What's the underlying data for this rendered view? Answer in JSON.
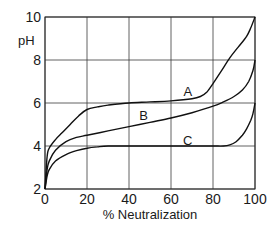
{
  "chart_data": {
    "type": "line",
    "title": "",
    "xlabel": "% Neutralization",
    "ylabel": "pH",
    "xlim": [
      0,
      100
    ],
    "ylim": [
      2,
      10
    ],
    "xticks": [
      0,
      20,
      40,
      60,
      80,
      100
    ],
    "yticks": [
      2,
      4,
      6,
      8,
      10
    ],
    "xtick_labels": [
      "0",
      "20",
      "40",
      "60",
      "80",
      "100"
    ],
    "ytick_labels": [
      "2",
      "4",
      "6",
      "8",
      "10"
    ],
    "grid": true,
    "legend": "none (curves labeled inline)",
    "series": [
      {
        "name": "A",
        "label_position": [
          68,
          6.55
        ],
        "x": [
          0,
          1,
          2,
          5,
          8,
          12,
          16,
          20,
          25,
          30,
          40,
          50,
          60,
          70,
          74,
          77,
          80,
          84,
          88,
          92,
          96,
          98,
          100
        ],
        "y": [
          2.0,
          3.5,
          3.9,
          4.3,
          4.6,
          5.0,
          5.4,
          5.7,
          5.82,
          5.9,
          6.0,
          6.05,
          6.1,
          6.2,
          6.3,
          6.5,
          6.9,
          7.5,
          8.1,
          8.6,
          9.1,
          9.5,
          10.0
        ]
      },
      {
        "name": "B",
        "label_position": [
          47,
          5.45
        ],
        "x": [
          0,
          1,
          2,
          5,
          10,
          15,
          20,
          30,
          40,
          50,
          60,
          70,
          80,
          85,
          90,
          94,
          97,
          99,
          100
        ],
        "y": [
          2.0,
          2.9,
          3.3,
          3.8,
          4.2,
          4.4,
          4.5,
          4.7,
          4.9,
          5.1,
          5.3,
          5.55,
          5.85,
          6.05,
          6.3,
          6.6,
          7.0,
          7.5,
          8.0
        ]
      },
      {
        "name": "C",
        "label_position": [
          68,
          4.3
        ],
        "x": [
          0,
          1,
          2,
          5,
          10,
          15,
          20,
          25,
          30,
          40,
          50,
          60,
          70,
          80,
          85,
          88,
          91,
          94,
          96,
          98,
          99,
          100
        ],
        "y": [
          2.0,
          2.6,
          2.9,
          3.3,
          3.6,
          3.78,
          3.9,
          3.96,
          4.0,
          4.0,
          4.0,
          4.0,
          4.0,
          4.0,
          4.0,
          4.05,
          4.2,
          4.5,
          4.8,
          5.2,
          5.5,
          6.0
        ]
      }
    ]
  }
}
